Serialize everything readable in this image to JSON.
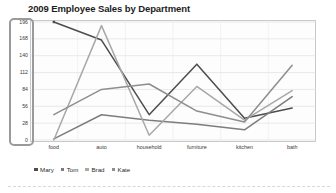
{
  "chart_data": {
    "type": "line",
    "title": "2009 Employee Sales by Department",
    "xlabel": "",
    "ylabel": "",
    "categories": [
      "food",
      "auto",
      "household",
      "furniture",
      "kitchen",
      "bath"
    ],
    "series": [
      {
        "name": "Mary",
        "color": "#4d4d4d",
        "values": [
          196,
          166,
          42,
          126,
          36,
          53
        ]
      },
      {
        "name": "Tom",
        "color": "#7d7d7d",
        "values": [
          2,
          42,
          33,
          26,
          17,
          72
        ]
      },
      {
        "name": "Brad",
        "color": "#a8a8a8",
        "values": [
          0,
          190,
          8,
          89,
          33,
          82
        ]
      },
      {
        "name": "Kate",
        "color": "#8e8e8e",
        "values": [
          42,
          84,
          93,
          48,
          30,
          124
        ]
      }
    ],
    "yticks": [
      0,
      28,
      56,
      84,
      112,
      140,
      168,
      196
    ],
    "ylim": [
      0,
      196
    ],
    "grid": true,
    "legend_position": "bottom",
    "axis_selected": "y-axis"
  },
  "legend": {
    "items": [
      {
        "label": "Mary"
      },
      {
        "label": "Tom"
      },
      {
        "label": "Brad"
      },
      {
        "label": "Kate"
      }
    ]
  },
  "colors": {
    "plot_border": "#c9c9c9",
    "gridline": "#dcdcdc",
    "selection_outline": "#9a9a9a",
    "title_text": "#1d1d1d",
    "tick_text": "#3a3a3a"
  }
}
